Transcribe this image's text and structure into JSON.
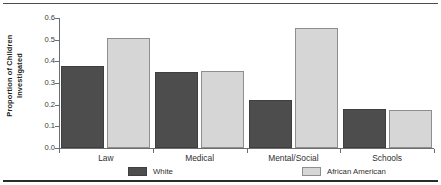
{
  "chart_data": {
    "type": "bar",
    "title": "",
    "xlabel": "",
    "ylabel_lines": [
      "Proportion of Children",
      "Investigated"
    ],
    "ylabel": "Proportion of Children Investigated",
    "categories": [
      "Law",
      "Medical",
      "Mental/Social",
      "Schools"
    ],
    "series": [
      {
        "name": "White",
        "color": "#4d4d4d",
        "values": [
          0.38,
          0.35,
          0.22,
          0.18
        ]
      },
      {
        "name": "African American",
        "color": "#d6d6d6",
        "values": [
          0.51,
          0.355,
          0.555,
          0.175
        ]
      }
    ],
    "ylim": [
      0.0,
      0.6
    ],
    "yticks": [
      "0.6",
      "0.5",
      "0.4",
      "0.3",
      "0.2",
      "0.1",
      "0.0"
    ],
    "ytick_values": [
      0.6,
      0.5,
      0.4,
      0.3,
      0.2,
      0.1,
      0.0
    ],
    "grid": false,
    "legend_position": "bottom"
  }
}
